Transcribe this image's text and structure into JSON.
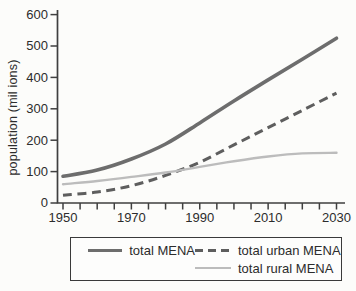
{
  "figure": {
    "background": "#fcfcfa",
    "text_color": "#2c2c2c",
    "axis_color": "#3f3f3f"
  },
  "chart_data": {
    "type": "line",
    "title": "",
    "xlabel": "",
    "ylabel": "population (mil ions)",
    "x": [
      1950,
      1960,
      1970,
      1980,
      1990,
      2000,
      2010,
      2020,
      2030
    ],
    "series": [
      {
        "name": "total MENA",
        "color": "#6d6d6d",
        "line": "solid",
        "width": 3.6,
        "values": [
          85,
          105,
          140,
          188,
          255,
          325,
          392,
          458,
          525
        ]
      },
      {
        "name": "total urban MENA",
        "color": "#5e5e5e",
        "line": "dashed",
        "width": 3,
        "values": [
          25,
          35,
          55,
          88,
          130,
          185,
          240,
          295,
          350
        ]
      },
      {
        "name": "total rural MENA",
        "color": "#bcbcbc",
        "line": "solid",
        "width": 2.4,
        "values": [
          60,
          70,
          83,
          97,
          115,
          133,
          148,
          158,
          160
        ]
      }
    ],
    "xlim": [
      1950,
      2030
    ],
    "ylim": [
      0,
      600
    ],
    "x_major_ticks": [
      1950,
      1970,
      1990,
      2010,
      2030
    ],
    "x_minor_tick_step_years": 5,
    "y_ticks": [
      0,
      100,
      200,
      300,
      400,
      500,
      600
    ],
    "grid": false,
    "legend_position": "bottom-box"
  },
  "legend": {
    "items": [
      {
        "label": "total MENA"
      },
      {
        "label": "total urban MENA"
      },
      {
        "label": "total rural MENA"
      }
    ]
  }
}
